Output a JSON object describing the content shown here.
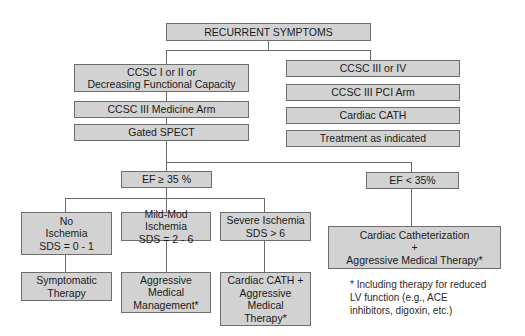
{
  "title": "RECURRENT SYMPTOMS",
  "left_branch": {
    "boxes": [
      {
        "lines": [
          "CCSC I or II or",
          "Decreasing Functional Capacity"
        ]
      },
      {
        "lines": [
          "CCSC III Medicine Arm"
        ]
      },
      {
        "lines": [
          "Gated SPECT"
        ]
      }
    ]
  },
  "right_branch": {
    "boxes": [
      {
        "lines": [
          "CCSC III or IV"
        ]
      },
      {
        "lines": [
          "CCSC III PCI Arm"
        ]
      },
      {
        "lines": [
          "Cardiac CATH"
        ]
      },
      {
        "lines": [
          "Treatment as indicated"
        ]
      }
    ]
  },
  "ef_split": {
    "high": {
      "label": "EF ≥ 35 %"
    },
    "low": {
      "label": "EF < 35%"
    }
  },
  "ischemia": [
    {
      "lines": [
        "No",
        "Ischemia",
        "SDS = 0 - 1"
      ],
      "outcome": [
        "Symptomatic",
        "Therapy"
      ]
    },
    {
      "lines": [
        "Mild-Mod Ischemia",
        "SDS = 2 - 6"
      ],
      "outcome": [
        "Aggressive",
        "Medical",
        "Management*"
      ]
    },
    {
      "lines": [
        "Severe Ischemia",
        "SDS > 6"
      ],
      "outcome": [
        "Cardiac CATH +",
        "Aggressive",
        "Medical",
        "Therapy*"
      ]
    }
  ],
  "low_ef_outcome": {
    "lines": [
      "Cardiac Catheterization",
      "+",
      "Aggressive Medical Therapy*"
    ]
  },
  "footnote": {
    "lines": [
      "* Including therapy for reduced",
      "LV function (e.g., ACE",
      "inhibitors, digoxin, etc.)"
    ]
  },
  "colors": {
    "box_fill": "#d2d2d2",
    "box_border": "#6e6e6e",
    "line": "#6a6a6a",
    "background": "#ffffff"
  }
}
